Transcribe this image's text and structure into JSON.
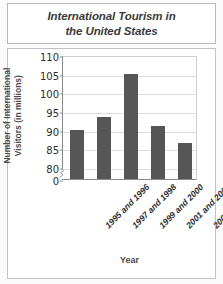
{
  "chart_data": {
    "type": "bar",
    "title": "International Tourism in the United States",
    "title_line1": "International Tourism in",
    "title_line2": "the United States",
    "xlabel": "Year",
    "ylabel": "Number of International Visitors (in millions)",
    "ylabel_line1": "Number of International",
    "ylabel_line2": "Visitors (in millions)",
    "categories": [
      "1995 and 1996",
      "1997 and 1998",
      "1999 and 2000",
      "2001 and 2002",
      "2003 and 2004"
    ],
    "values": [
      90,
      93.5,
      105,
      91,
      86.3
    ],
    "ylim": [
      80,
      110
    ],
    "y_ticks": [
      "110",
      "105",
      "100",
      "95",
      "90",
      "85",
      "80",
      "0"
    ],
    "y_tick_values": [
      110,
      105,
      100,
      95,
      90,
      85,
      80,
      0
    ],
    "axis_break": true,
    "grid": true,
    "legend": "none",
    "bar_color": "#565656",
    "grid_color": "#dcdcdc",
    "plot_background": "#ffffff",
    "axis_color": "#8a8a8a"
  }
}
